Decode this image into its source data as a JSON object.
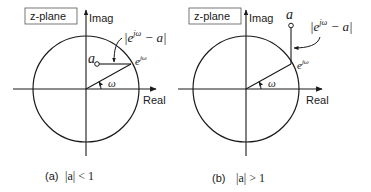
{
  "panels": [
    {
      "id": "a",
      "plane_label": "z-plane",
      "imag_label": "Imag",
      "real_label": "Real",
      "point_label": "a",
      "unit_point_label": "e",
      "unit_point_exp": "jω",
      "angle_label": "ω",
      "distance_label_left": "|e",
      "distance_label_exp": "jω",
      "distance_label_right": " − a|",
      "caption_tag": "(a)",
      "caption_cond": "|a| < 1"
    },
    {
      "id": "b",
      "plane_label": "z-plane",
      "imag_label": "Imag",
      "real_label": "Real",
      "point_label": "a",
      "unit_point_label": "e",
      "unit_point_exp": "jω",
      "angle_label": "ω",
      "distance_label_left": "|e",
      "distance_label_exp": "jω",
      "distance_label_right": " − a|",
      "caption_tag": "(b)",
      "caption_cond": "|a| > 1"
    }
  ],
  "colors": {
    "ink": "#1a1a1a",
    "background": "#ffffff",
    "label_box_border": "#555555"
  }
}
